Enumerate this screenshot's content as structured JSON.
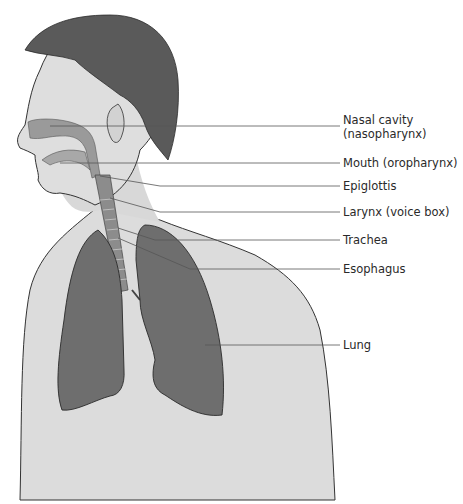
{
  "figure": {
    "colors": {
      "background": "#ffffff",
      "skin": "#dcdcdc",
      "skin_shadow": "#c9c9c9",
      "hair": "#5a5a5a",
      "lung": "#6e6e6e",
      "airway": "#9a9a9a",
      "trachea": "#8c8c8c",
      "outline": "#333333",
      "leader_line": "#555555",
      "label_text": "#2a2a2a"
    }
  },
  "labels": [
    {
      "id": "nasal-cavity",
      "line1": "Nasal cavity",
      "line2": "(nasopharynx)",
      "y": 126,
      "target": [
        50,
        126
      ]
    },
    {
      "id": "mouth",
      "line1": "Mouth (oropharynx)",
      "y": 163,
      "target": [
        60,
        163
      ]
    },
    {
      "id": "epiglottis",
      "line1": "Epiglottis",
      "y": 186,
      "target": [
        100,
        176
      ]
    },
    {
      "id": "larynx",
      "line1": "Larynx (voice box)",
      "y": 212,
      "target": [
        110,
        198
      ]
    },
    {
      "id": "trachea",
      "line1": "Trachea",
      "y": 240,
      "target": [
        118,
        235
      ]
    },
    {
      "id": "esophagus",
      "line1": "Esophagus",
      "y": 269,
      "target": [
        118,
        238
      ]
    },
    {
      "id": "lung",
      "line1": "Lung",
      "y": 345,
      "target": [
        205,
        345
      ]
    }
  ]
}
